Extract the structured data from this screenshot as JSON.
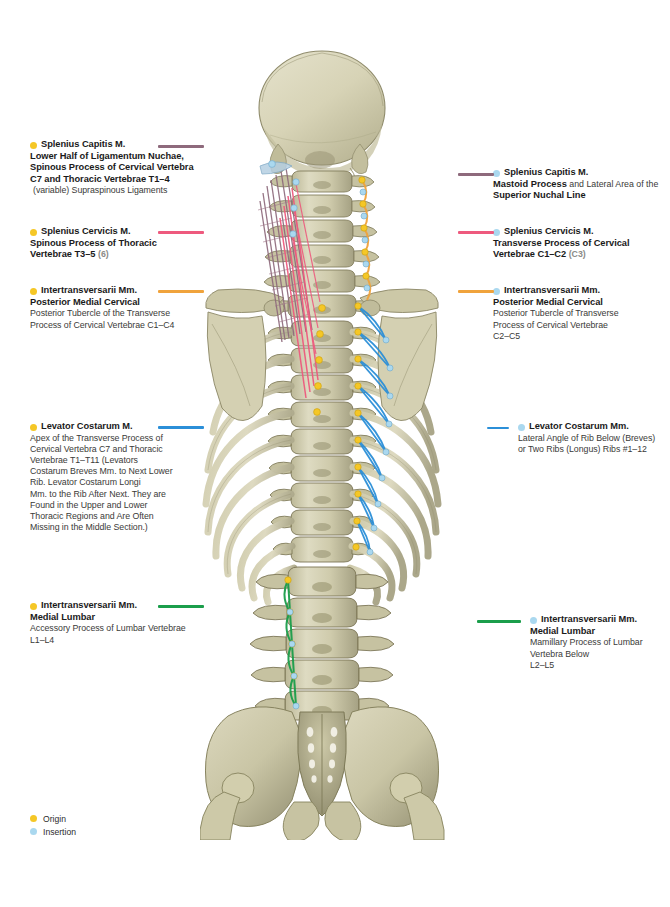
{
  "figure": {
    "bone_color": "#cfc9a8",
    "bone_shadow": "#8d8a68",
    "origin_color": "#f5c726",
    "insertion_color": "#aad8ef"
  },
  "legend": {
    "items": [
      {
        "label": "Origin",
        "marker": "origin-dot",
        "color": "#f5c726"
      },
      {
        "label": "Insertion",
        "marker": "insertion-dot",
        "color": "#aad8ef"
      }
    ]
  },
  "labels_left": [
    {
      "id": "splenius-capitis-origin",
      "marker": "origin-dot",
      "rule_color": "#8e6a7c",
      "title": "Splenius Capitis M.",
      "lines_bold": [
        "Lower Half of Ligamentum Nuchae,",
        "Spinous Process of Cervical Vertebra",
        "C7 and Thoracic Vertebrae T1–4"
      ],
      "note": "(variable) Supraspinous Ligaments"
    },
    {
      "id": "splenius-cervicis-origin",
      "marker": "origin-dot",
      "rule_color": "#ee5a7e",
      "title": "Splenius Cervicis M.",
      "lines_bold": [
        "Spinous Process of Thoracic",
        "Vertebrae T3–5"
      ],
      "suffix_dim": "(6)"
    },
    {
      "id": "intertransversarii-cervical-origin",
      "marker": "origin-dot",
      "rule_color": "#f0a33c",
      "title": "Intertransversarii Mm.",
      "subtitle": "Posterior Medial Cervical",
      "lines_body": [
        "Posterior Tubercle of the Transverse",
        "Process of Cervical Vertebrae C1–C4"
      ]
    },
    {
      "id": "levator-costarum-origin",
      "marker": "origin-dot",
      "rule_color": "#2b8fd8",
      "title": "Levator Costarum M.",
      "lines_body": [
        "Apex of the Transverse Process of",
        "Cervical Vertebra C7 and Thoracic",
        "Vertebrae  T1–T11 (Levators",
        "Costarum Breves Mm. to Next Lower",
        "Rib. Levator Costarum Longi",
        "Mm. to the Rib After Next.  They are",
        "Found in the Upper and Lower",
        "Thoracic Regions and Are Often",
        "Missing in the Middle Section.)"
      ]
    },
    {
      "id": "intertransversarii-lumbar-origin",
      "marker": "origin-dot",
      "rule_color": "#1b9e4b",
      "title": "Intertransversarii Mm.",
      "subtitle": "Medial Lumbar",
      "lines_body": [
        "Accessory Process of Lumbar  Vertebrae",
        "L1–L4"
      ]
    }
  ],
  "labels_right": [
    {
      "id": "splenius-capitis-insertion",
      "marker": "insertion-dot",
      "rule_color": "#8e6a7c",
      "title": "Splenius Capitis M.",
      "mixed_line": {
        "bold": "Mastoid Process",
        "plain": " and Lateral Area of the"
      },
      "subtitle": "Superior Nuchal Line"
    },
    {
      "id": "splenius-cervicis-insertion",
      "marker": "insertion-dot",
      "rule_color": "#ee5a7e",
      "title": "Splenius Cervicis M.",
      "lines_bold": [
        "Transverse Process of Cervical",
        "Vertebrae  C1–C2"
      ],
      "suffix_dim": "(C3)"
    },
    {
      "id": "intertransversarii-cervical-insertion",
      "marker": "insertion-dot",
      "rule_color": "#f0a33c",
      "title": "Intertransversarii Mm.",
      "subtitle": "Posterior Medial Cervical",
      "lines_body": [
        "Posterior Tubercle of Transverse",
        "Process of Cervical Vertebrae",
        "C2–C5"
      ]
    },
    {
      "id": "levator-costarum-insertion",
      "marker": "insertion-dot",
      "rule_color": "#2b8fd8",
      "title": "Levator Costarum Mm.",
      "lines_body": [
        "Lateral Angle of Rib Below (Breves)",
        "or Two Ribs (Longus) Ribs #1–12"
      ]
    },
    {
      "id": "intertransversarii-lumbar-insertion",
      "marker": "insertion-dot",
      "rule_color": "#1b9e4b",
      "title": "Intertransversarii Mm.",
      "subtitle": "Medial Lumbar",
      "lines_body": [
        "Mamillary Process of  Lumbar",
        "Vertebra Below",
        "L2–L5"
      ]
    }
  ]
}
